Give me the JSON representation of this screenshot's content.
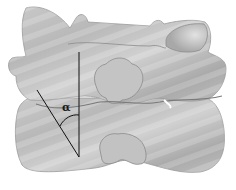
{
  "figure": {
    "annotation": {
      "angle_symbol": "α",
      "description": "angle between vertical reference line and facet joint line"
    },
    "colors": {
      "background": "#ffffff",
      "bone_light": "#d4d4d4",
      "bone_mid": "#b2b2b2",
      "bone_dark": "#8a8a8a",
      "line": "#111111"
    }
  }
}
